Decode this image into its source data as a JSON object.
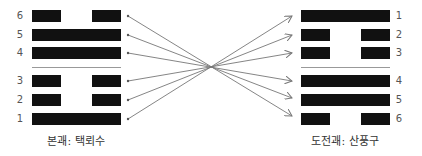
{
  "left_hexagram": {
    "caption": "본괘: 택뢰수",
    "lines": [
      {
        "label": "6",
        "type": "broken"
      },
      {
        "label": "5",
        "type": "solid"
      },
      {
        "label": "4",
        "type": "solid"
      },
      {
        "label": "3",
        "type": "broken"
      },
      {
        "label": "2",
        "type": "broken"
      },
      {
        "label": "1",
        "type": "solid"
      }
    ]
  },
  "right_hexagram": {
    "caption": "도전괘: 산풍구",
    "lines": [
      {
        "label": "1",
        "type": "solid"
      },
      {
        "label": "2",
        "type": "broken"
      },
      {
        "label": "3",
        "type": "broken"
      },
      {
        "label": "4",
        "type": "solid"
      },
      {
        "label": "5",
        "type": "solid"
      },
      {
        "label": "6",
        "type": "broken"
      }
    ]
  },
  "colors": {
    "bar": "#111111",
    "arrow": "#777777",
    "separator": "#999999"
  }
}
